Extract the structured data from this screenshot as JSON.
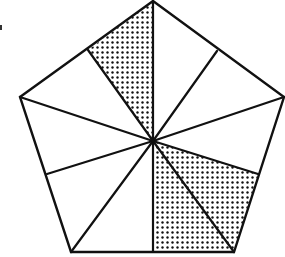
{
  "diagram": {
    "type": "pentagon-partition",
    "center": [
      153,
      141
    ],
    "stroke_color": "#111111",
    "fill_color": "#ffffff",
    "dot_color": "#111111",
    "vertices": {
      "top": [
        153,
        1
      ],
      "right": [
        284,
        97
      ],
      "bottom_right": [
        234,
        252
      ],
      "bottom_left": [
        71,
        252
      ],
      "left": [
        20,
        97
      ]
    },
    "edge_midpoints": {
      "upper_right": [
        217,
        51
      ],
      "lower_right": [
        258,
        174
      ],
      "bottom": [
        153,
        252
      ],
      "lower_left": [
        47,
        174
      ],
      "upper_left": [
        88,
        50
      ]
    },
    "total_regions": 10,
    "shaded_regions": 3,
    "shaded": [
      {
        "name": "upper-left-top",
        "points": [
          [
            153,
            141
          ],
          [
            88,
            50
          ],
          [
            153,
            1
          ]
        ]
      },
      {
        "name": "bottom-mid-right",
        "points": [
          [
            153,
            141
          ],
          [
            153,
            252
          ],
          [
            234,
            252
          ]
        ]
      },
      {
        "name": "right-lower",
        "points": [
          [
            153,
            141
          ],
          [
            234,
            252
          ],
          [
            258,
            174
          ]
        ]
      }
    ]
  }
}
